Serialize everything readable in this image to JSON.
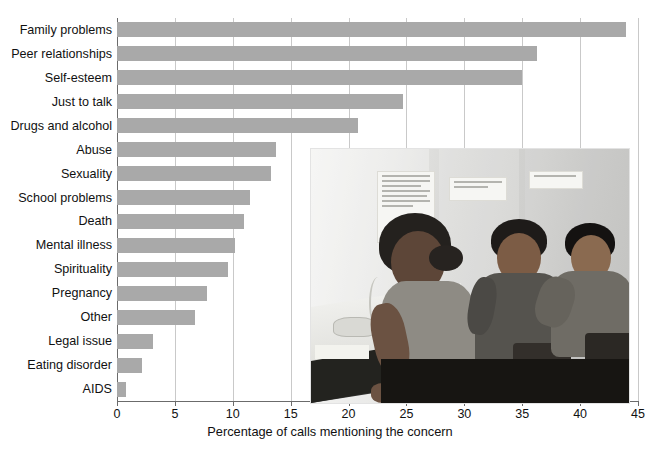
{
  "chart_data": {
    "type": "bar",
    "orientation": "horizontal",
    "title": "",
    "xlabel": "Percentage of calls mentioning the concern",
    "ylabel": "",
    "xlim": [
      0,
      45
    ],
    "xticks": [
      0,
      5,
      10,
      15,
      20,
      25,
      30,
      35,
      40,
      45
    ],
    "grid": "vertical",
    "legend": "none",
    "bar_color": "#a9a9a9",
    "categories": [
      "Family problems",
      "Peer relationships",
      "Self-esteem",
      "Just to talk",
      "Drugs and alcohol",
      "Abuse",
      "Sexuality",
      "School problems",
      "Death",
      "Mental illness",
      "Spirituality",
      "Pregnancy",
      "Other",
      "Legal issue",
      "Eating disorder",
      "AIDS"
    ],
    "values": [
      44.0,
      36.3,
      35.0,
      24.7,
      20.8,
      13.7,
      13.3,
      11.5,
      11.0,
      10.2,
      9.6,
      7.8,
      6.7,
      3.1,
      2.2,
      0.8
    ]
  },
  "inset_photo": {
    "caption": "",
    "description": "Three teenagers seated at a crisis hotline call centre; a young woman in the foreground speaks on a telephone at a desk, two young men sit behind her along the wall",
    "wall_notes": [
      "Thank you for...",
      "LISTEN WITH CARE! SAVE A LIFE!",
      "TEENS HOT LINE"
    ]
  }
}
